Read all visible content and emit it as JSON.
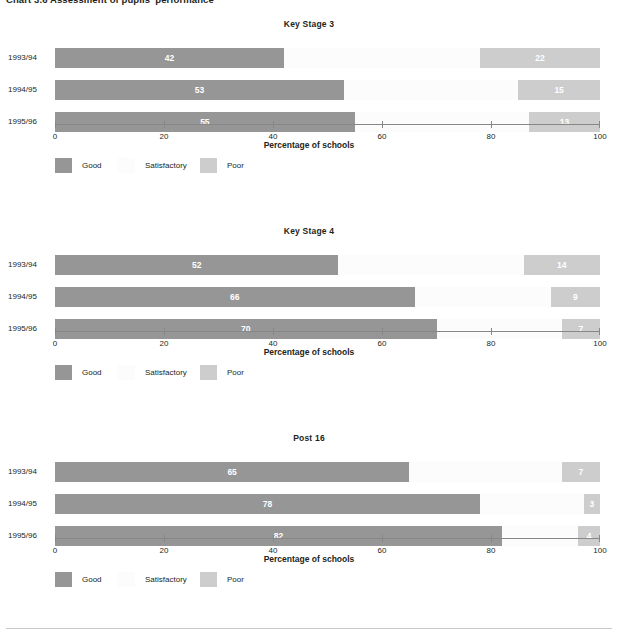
{
  "figure": {
    "caption": "Chart 3.6 Assessment of pupils' performance"
  },
  "legend": {
    "items": [
      {
        "label": "Good",
        "color": "#969696",
        "left": 55
      },
      {
        "label": "Satisfactory",
        "color": "#fcfcfc",
        "left": 118
      },
      {
        "label": "Poor",
        "color": "#cdcdcd",
        "left": 200
      }
    ]
  },
  "axis": {
    "title": "Percentage of schools",
    "min": 0,
    "max": 100,
    "ticks": [
      0,
      20,
      40,
      60,
      80,
      100
    ],
    "tick_labels": [
      "0",
      "20",
      "40",
      "60",
      "80",
      "100"
    ]
  },
  "colors": {
    "good": "#969696",
    "satisfactory": "#fcfcfc",
    "poor": "#cdcdcd",
    "axis": "#878787",
    "text": "#231f20",
    "value_text": "#ffffff"
  },
  "chart_data": [
    {
      "type": "bar",
      "orientation": "horizontal",
      "stacked": true,
      "title": "Key Stage 3",
      "xlabel": "Percentage of schools",
      "ylabel": "",
      "xlim": [
        0,
        100
      ],
      "grid": false,
      "legend_position": "below",
      "categories": [
        "1993/94",
        "1994/95",
        "1995/96"
      ],
      "series": [
        {
          "name": "Good",
          "values": [
            42,
            53,
            55
          ]
        },
        {
          "name": "Satisfactory",
          "values": [
            36,
            32,
            32
          ]
        },
        {
          "name": "Poor",
          "values": [
            22,
            15,
            13
          ]
        }
      ],
      "labelled_series": [
        "Good",
        "Poor"
      ]
    },
    {
      "type": "bar",
      "orientation": "horizontal",
      "stacked": true,
      "title": "Key Stage 4",
      "xlabel": "Percentage of schools",
      "ylabel": "",
      "xlim": [
        0,
        100
      ],
      "grid": false,
      "legend_position": "below",
      "categories": [
        "1993/94",
        "1994/95",
        "1995/96"
      ],
      "series": [
        {
          "name": "Good",
          "values": [
            52,
            66,
            70
          ]
        },
        {
          "name": "Satisfactory",
          "values": [
            34,
            25,
            23
          ]
        },
        {
          "name": "Poor",
          "values": [
            14,
            9,
            7
          ]
        }
      ],
      "labelled_series": [
        "Good",
        "Poor"
      ]
    },
    {
      "type": "bar",
      "orientation": "horizontal",
      "stacked": true,
      "title": "Post 16",
      "xlabel": "Percentage of schools",
      "ylabel": "",
      "xlim": [
        0,
        100
      ],
      "grid": false,
      "legend_position": "below",
      "categories": [
        "1993/94",
        "1994/95",
        "1995/96"
      ],
      "series": [
        {
          "name": "Good",
          "values": [
            65,
            78,
            82
          ]
        },
        {
          "name": "Satisfactory",
          "values": [
            28,
            19,
            14
          ]
        },
        {
          "name": "Poor",
          "values": [
            7,
            3,
            4
          ]
        }
      ],
      "labelled_series": [
        "Good",
        "Poor"
      ]
    }
  ]
}
